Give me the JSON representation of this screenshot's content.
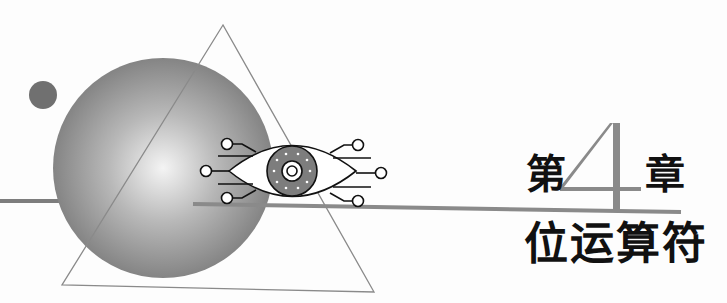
{
  "chapter": {
    "prefix": "第",
    "number": "4",
    "suffix": "章",
    "title": "位运算符"
  },
  "colors": {
    "background": "#fdfdfd",
    "sphere_dark": "#7a7a7a",
    "sphere_light": "#f2f2f2",
    "dot": "#707070",
    "line": "#8a8a8a",
    "triangle_stroke": "#8a8a8a",
    "number_fill": "#8a8a8a",
    "text": "#111111"
  },
  "icons": [
    "sphere",
    "small-dot",
    "triangle-outline",
    "circuit-eye-icon",
    "horizontal-rule"
  ]
}
